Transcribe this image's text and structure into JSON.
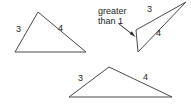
{
  "figure": {
    "width": 191,
    "height": 105,
    "background_color": "#ffffff",
    "stroke_color": "#4a4a4a",
    "text_color": "#1d1d1d",
    "arrow_color": "#2e2e2e"
  },
  "callout": {
    "line1": "greater",
    "line2": "than 1",
    "full_text": "greater than 1",
    "arrow_name": "callout-arrow"
  },
  "shapes": {
    "triangle_left": {
      "name": "triangle-left",
      "points": "38,12 86,52 15,52",
      "labels": {
        "side_a": "3",
        "side_b": "4"
      }
    },
    "triangle_thin": {
      "name": "triangle-thin",
      "points": "186,2 138,52 136,30",
      "labels": {
        "side_a": "3",
        "side_b": "4"
      }
    },
    "triangle_bottom": {
      "name": "triangle-bottom",
      "points": "109,67 172,97 69,97",
      "labels": {
        "side_a": "3",
        "side_b": "4"
      }
    }
  }
}
